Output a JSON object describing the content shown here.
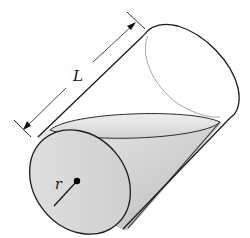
{
  "diagram": {
    "labels": {
      "length": "L",
      "radius": "r"
    },
    "colors": {
      "outline": "#1a1a1a",
      "thin_outline": "#9a9a9a",
      "cone_fill_light": "#e6e6e6",
      "cone_fill_dark": "#bdbdbd",
      "base_fill": "#d8d8d8",
      "dimension_line": "#333333"
    }
  }
}
